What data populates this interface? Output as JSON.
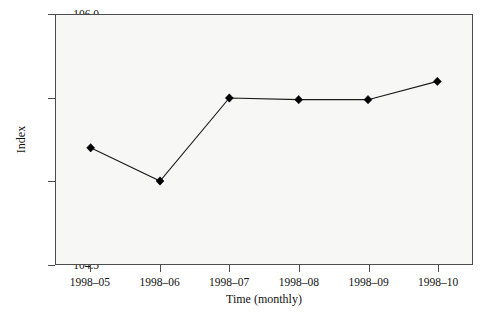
{
  "chart_data": {
    "type": "line",
    "title": "",
    "xlabel": "Time (monthly)",
    "ylabel": "Index",
    "categories": [
      "1998–05",
      "1998–06",
      "1998–07",
      "1998–08",
      "1998–09",
      "1998–10"
    ],
    "values": [
      105.2,
      105.0,
      105.5,
      105.49,
      105.49,
      105.6
    ],
    "series": [
      {
        "name": "Index",
        "values": [
          105.2,
          105.0,
          105.5,
          105.49,
          105.49,
          105.6
        ]
      }
    ],
    "ylim": [
      104.5,
      106.0
    ],
    "yticks": [
      104.5,
      105.0,
      105.5,
      106.0
    ],
    "ytick_labels": [
      "104.5",
      "105.0",
      "105.5",
      "106.0"
    ],
    "grid": false,
    "legend": false,
    "marker": "diamond",
    "line_color": "#1a1a1a",
    "marker_color": "#000000",
    "plot_background": "#f7f7f5",
    "axis_color": "#4d4d4d"
  },
  "axes": {
    "y_title": "Index",
    "x_title": "Time (monthly)"
  }
}
